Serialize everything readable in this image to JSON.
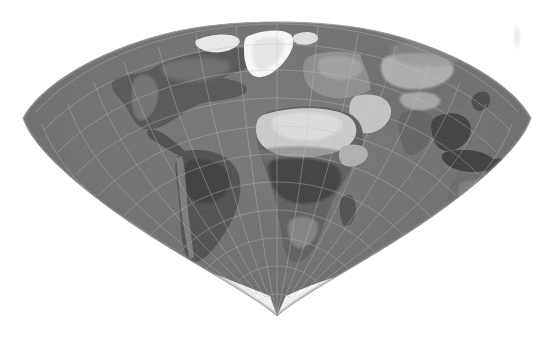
{
  "figure": {
    "caption": "",
    "background_color": "#ffffff",
    "width": 553,
    "height": 343
  },
  "map": {
    "projection_name": "Bonne / Werner cordiform projection",
    "shape": "heart-shaped (cordiform) with rounded upper arc and pointed southern apex",
    "imagery_style": "grayscale shaded relief satellite composite",
    "central_meridian_label": "0",
    "ocean_color": "#6e6e6e",
    "ocean_color_light": "#7d7d7d",
    "land_color": "#5a5a5a",
    "desert_color": "#cfcfcf",
    "forest_color": "#3e3e3e",
    "ice_color": "#fbfbfb",
    "graticule_color": "#b9b9b9",
    "outline_color": "#9a9a9a",
    "apex": {
      "x": 277,
      "y": 316
    },
    "left_extent_x": 22,
    "right_extent_x": 532,
    "top_extent_y": 22,
    "graticule": {
      "enabled": true,
      "meridian_spacing_degrees": 15,
      "parallel_spacing_degrees": 15,
      "line_opacity": 0.55
    },
    "features": [
      {
        "name": "greenland",
        "label": "Greenland",
        "type": "ice-sheet",
        "tone": "ice"
      },
      {
        "name": "north-america",
        "label": "North America",
        "type": "continent",
        "tone": "land"
      },
      {
        "name": "south-america",
        "label": "South America",
        "type": "continent",
        "tone": "land"
      },
      {
        "name": "amazon-basin",
        "label": "Amazon Basin",
        "type": "rainforest",
        "tone": "forest"
      },
      {
        "name": "africa",
        "label": "Africa",
        "type": "continent",
        "tone": "land"
      },
      {
        "name": "sahara-desert",
        "label": "Sahara Desert",
        "type": "desert",
        "tone": "desert"
      },
      {
        "name": "congo-basin",
        "label": "Congo Basin",
        "type": "rainforest",
        "tone": "forest"
      },
      {
        "name": "europe",
        "label": "Europe",
        "type": "continent",
        "tone": "land"
      },
      {
        "name": "arabian-peninsula",
        "label": "Arabian Peninsula",
        "type": "desert",
        "tone": "desert"
      },
      {
        "name": "asia",
        "label": "Asia",
        "type": "continent",
        "tone": "land"
      },
      {
        "name": "central-asia-deserts",
        "label": "Central Asian Deserts",
        "type": "desert",
        "tone": "desert"
      },
      {
        "name": "india",
        "label": "India",
        "type": "subcontinent",
        "tone": "land"
      },
      {
        "name": "southeast-asia",
        "label": "Southeast Asia",
        "type": "archipelago",
        "tone": "forest"
      },
      {
        "name": "australia",
        "label": "Australia",
        "type": "continent",
        "tone": "land"
      },
      {
        "name": "antarctica",
        "label": "Antarctica",
        "type": "ice-sheet",
        "tone": "ice"
      },
      {
        "name": "madagascar",
        "label": "Madagascar",
        "type": "island",
        "tone": "land"
      }
    ]
  }
}
